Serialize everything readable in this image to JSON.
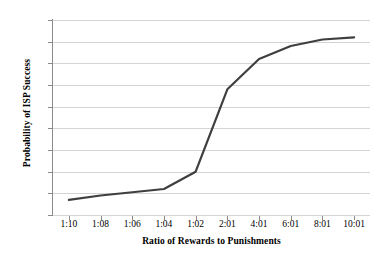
{
  "chart_data": {
    "type": "line",
    "title": "",
    "xlabel": "Ratio of Rewards to Punishments",
    "ylabel": "Probability of ISP Success",
    "categories": [
      "1:10",
      "1:08",
      "1:06",
      "1:04",
      "1:02",
      "2:01",
      "4:01",
      "6:01",
      "8:01",
      "10:01"
    ],
    "values": [
      7,
      9,
      10.5,
      12,
      20,
      58,
      72,
      78,
      81,
      82
    ],
    "series": [
      {
        "name": "Probability of ISP Success",
        "values": [
          7,
          9,
          10.5,
          12,
          20,
          58,
          72,
          78,
          81,
          82
        ]
      }
    ],
    "y_tick_labels": [
      "90%",
      "80%",
      "70%",
      "60%",
      "50%",
      "40%",
      "30%",
      "20%",
      "10%",
      "0%"
    ],
    "y_tick_values": [
      90,
      80,
      70,
      60,
      50,
      40,
      30,
      20,
      10,
      0
    ],
    "ylim": [
      0,
      90
    ],
    "grid": true,
    "legend": "none",
    "line_color": "#3f3f3f",
    "grid_color": "#d4d4d4",
    "axis_color": "#8a8a8a",
    "background_color": "#ffffff"
  }
}
